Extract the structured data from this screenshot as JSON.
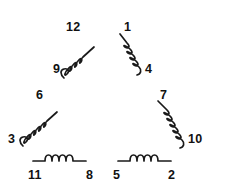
{
  "diagram": {
    "stroke_color": "#1a1a1a",
    "background_color": "#ffffff",
    "label_color": "#111111",
    "coils": [
      {
        "id": "coil-upper-left",
        "orientation": "diagonal-up-right",
        "loops": 4,
        "start_terminal": "9",
        "end_terminal": "12"
      },
      {
        "id": "coil-upper-right",
        "orientation": "diagonal-down-right",
        "loops": 4,
        "start_terminal": "1",
        "end_terminal": "4"
      },
      {
        "id": "coil-lower-left",
        "orientation": "diagonal-up-right",
        "loops": 4,
        "start_terminal": "3",
        "end_terminal": "6"
      },
      {
        "id": "coil-lower-right",
        "orientation": "diagonal-down-right",
        "loops": 4,
        "start_terminal": "7",
        "end_terminal": "10"
      },
      {
        "id": "coil-bottom-left",
        "orientation": "horizontal",
        "loops": 4,
        "start_terminal": "11",
        "end_terminal": "8"
      },
      {
        "id": "coil-bottom-right",
        "orientation": "horizontal",
        "loops": 4,
        "start_terminal": "5",
        "end_terminal": "2"
      }
    ],
    "terminals": [
      {
        "name": "terminal-12",
        "label": "12",
        "x": 66,
        "y": 21
      },
      {
        "name": "terminal-1",
        "label": "1",
        "x": 124,
        "y": 21
      },
      {
        "name": "terminal-9",
        "label": "9",
        "x": 53,
        "y": 63
      },
      {
        "name": "terminal-4",
        "label": "4",
        "x": 145,
        "y": 63
      },
      {
        "name": "terminal-6",
        "label": "6",
        "x": 36,
        "y": 89
      },
      {
        "name": "terminal-7",
        "label": "7",
        "x": 160,
        "y": 89
      },
      {
        "name": "terminal-3",
        "label": "3",
        "x": 8,
        "y": 133
      },
      {
        "name": "terminal-10",
        "label": "10",
        "x": 188,
        "y": 133
      },
      {
        "name": "terminal-11",
        "label": "11",
        "x": 28,
        "y": 169
      },
      {
        "name": "terminal-8",
        "label": "8",
        "x": 86,
        "y": 169
      },
      {
        "name": "terminal-5",
        "label": "5",
        "x": 113,
        "y": 169
      },
      {
        "name": "terminal-2",
        "label": "2",
        "x": 168,
        "y": 169
      }
    ]
  }
}
